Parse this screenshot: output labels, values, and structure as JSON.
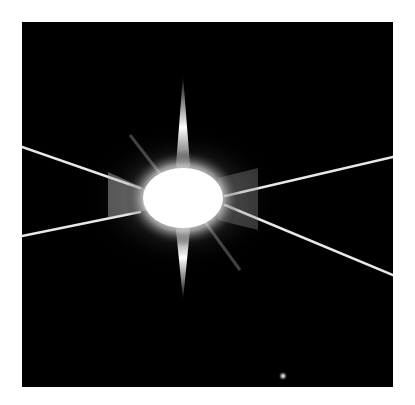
{
  "image": {
    "subject": "bright star with diffraction spikes",
    "background_color": "#000000",
    "border_color": "#ffffff",
    "star": {
      "center_x": 183,
      "center_y": 198,
      "color": "#ffffff"
    },
    "companion": {
      "x": 283,
      "y": 376,
      "color": "#ffffff"
    }
  }
}
